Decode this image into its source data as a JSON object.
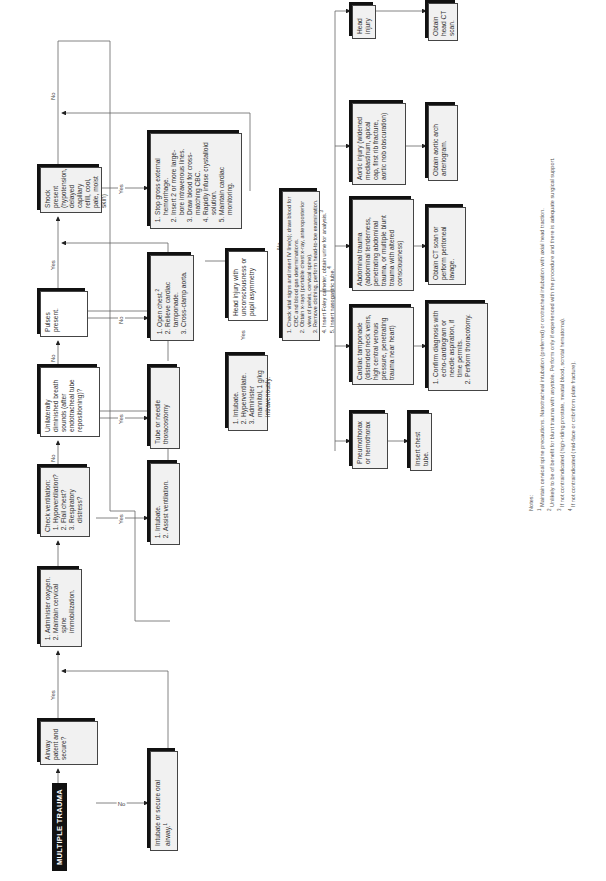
{
  "title": "MULTIPLE TRAUMA",
  "nodes": {
    "airway": "Airway patent and secure?",
    "intubate_secure": "Intubate or secure oral airway.",
    "intubate_secure_note": "1",
    "oxygen": [
      "Administer oxygen.",
      "Maintain cervical spine immobilization."
    ],
    "check_vent": {
      "heading": "Check ventilation:",
      "items": [
        "Hypoventilation?",
        "Flail chest?",
        "Respiratory distress?"
      ]
    },
    "intubate_assist": [
      "Intubate.",
      "Assist ventilation."
    ],
    "breath_sounds": "Unilaterally diminished breath sounds (after endotracheal tube repositioning)?",
    "thoracostomy": "Tube or needle thoracostomy",
    "pulses": "Pulses present.",
    "open_chest": [
      "Open chest.",
      "Relieve cardiac tamponade.",
      "Cross-clamp aorta."
    ],
    "open_chest_note": "2",
    "shock": "Shock present (hypotension, delayed capillary refill, cool, pale, moist skin)",
    "shock_actions": [
      "Stop gross external hemorrhage.",
      "Insert 2 or more large-bore intravenous lines.",
      "Draw blood for cross-matching CBC.",
      "Rapidly infuse crystalloid solution.",
      "Maintain cardiac monitoring."
    ],
    "head_injury_q": "Head injury with unconsciousness or pupil asymmetry",
    "intubate_hyper": [
      "Intubate.",
      "Hyperventilate.",
      "Administer mannitol, 1 g/kg intravenously."
    ],
    "check_vitals": [
      "Check vital signs and insert IV line(s); draw blood for CBC and blood gas determinations.",
      "Obtain x-rays (portable chest x-ray, anteroposterior view of pelvis, cervical spine).",
      "Remove clothing, perform head-to-toe examination.",
      "Insert Foley catheter, obtain urine for analysis.",
      "Insert nasogastric tube."
    ],
    "check_vitals_notes": {
      "foley": "3",
      "ng": "4"
    },
    "pneumothorax": "Pneumothorax or hemothorax",
    "chest_tube": "Insert chest tube.",
    "tamponade": "Cardiac tamponade (distended neck veins, high central venous pressure, penetrating trauma near heart)",
    "confirm_diag": [
      "Confirm diagnosis with echo-cardiogram or needle aspiration, if time permits.",
      "Perform thoracotomy."
    ],
    "abdominal": "Abdominal trauma (abdominal tenderness, penetrating abdominal trauma, or multiple blunt trauma with altered consciousness)",
    "ct_lavage": "Obtain CT scan or perform peritoneal lavage.",
    "aortic": "Aortic injury (widened mediastinum, apical cap, first rib fracture, aortic nob obscuration)",
    "arteriogram": "Obtain aortic arch arteriogram.",
    "head_injury": "Head injury",
    "head_ct": "Obtain head CT scan."
  },
  "edge_labels": {
    "yes": "Yes",
    "no": "No"
  },
  "notes": {
    "heading": "Notes:",
    "items": [
      {
        "num": "1",
        "text": "Maintain cervical spine precautions. Nasotracheal intubation (preferred) or orotracheal intubation with axial head traction."
      },
      {
        "num": "2",
        "text": "Unlikely to be of benefit for blunt trauma with asystole. Perform only if experienced with the procedure and there is adequate surgical support."
      },
      {
        "num": "3",
        "text": "If not contraindicated (high-riding prostate, meatal blood, scrotal hematoma)."
      },
      {
        "num": "4",
        "text": "If not contraindicated (mid-face or cribriform plate fracture)."
      }
    ]
  }
}
